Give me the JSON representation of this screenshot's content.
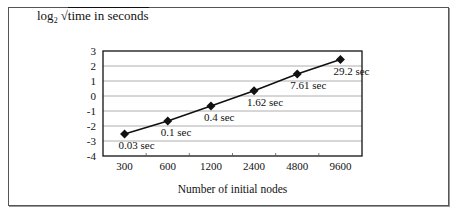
{
  "chart_data": {
    "type": "line",
    "title": "",
    "ylabel": "log2 √time in seconds",
    "ylabel_parts": {
      "log": "log",
      "base": "2",
      "radical": "√",
      "radicand": "time in seconds"
    },
    "xlabel": "Number of initial nodes",
    "categories": [
      "300",
      "600",
      "1200",
      "2400",
      "4800",
      "9600"
    ],
    "series": [
      {
        "name": "Runtime",
        "values": [
          -2.53,
          -1.66,
          -0.66,
          0.35,
          1.46,
          2.43
        ],
        "data_labels": [
          "0.03 sec",
          "0.1 sec",
          "0.4 sec",
          "1.62 sec",
          "7.61 sec",
          "29.2 sec"
        ],
        "marker": "diamond",
        "color": "#111111"
      }
    ],
    "yticks": [
      "3",
      "2",
      "1",
      "0",
      "-1",
      "-2",
      "-3",
      "-4"
    ],
    "ylim": [
      -4,
      3
    ],
    "grid": true,
    "legend": "none"
  }
}
